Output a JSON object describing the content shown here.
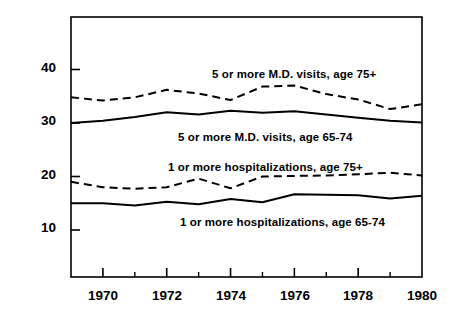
{
  "chart_data": {
    "type": "line",
    "title": "",
    "xlabel": "",
    "ylabel": "Percentage",
    "xlim": [
      1969,
      1980
    ],
    "ylim": [
      4.5,
      48
    ],
    "grid": false,
    "legend_position": "inline-annotations",
    "x": [
      1969,
      1970,
      1971,
      1972,
      1973,
      1974,
      1975,
      1976,
      1977,
      1978,
      1979,
      1980
    ],
    "x_tick_labels": [
      "1970",
      "1972",
      "1974",
      "1976",
      "1978",
      "1980"
    ],
    "x_major_ticks": [
      1970,
      1972,
      1974,
      1976,
      1978,
      1980
    ],
    "x_minor_ticks": [
      1971,
      1973,
      1975,
      1977,
      1979
    ],
    "y_tick_labels": [
      "10",
      "20",
      "30",
      "40"
    ],
    "y_ticks": [
      10,
      20,
      30,
      40
    ],
    "series": [
      {
        "name": "5 or more M.D. visits, age 75+",
        "style": "dashed",
        "values": [
          34.8,
          34.2,
          34.8,
          36.2,
          35.5,
          34.3,
          36.8,
          37.0,
          35.4,
          34.4,
          32.6,
          33.5
        ]
      },
      {
        "name": "5 or more M.D. visits, age 65-74",
        "style": "solid",
        "values": [
          30.0,
          30.4,
          31.1,
          32.0,
          31.6,
          32.3,
          31.9,
          32.2,
          31.6,
          31.0,
          30.4,
          30.1
        ]
      },
      {
        "name": "1 or more hospitalizations, age 75+",
        "style": "dashed",
        "values": [
          19.0,
          18.0,
          17.7,
          18.0,
          19.6,
          17.8,
          20.0,
          20.1,
          20.2,
          20.4,
          20.7,
          20.2
        ]
      },
      {
        "name": "1 or more hospitalizations, age 65-74",
        "style": "solid",
        "values": [
          15.0,
          15.0,
          14.6,
          15.3,
          14.8,
          15.8,
          15.2,
          16.7,
          16.6,
          16.5,
          15.9,
          16.4
        ]
      }
    ],
    "annotations": [
      {
        "text": "5 or more M.D. visits, age 75+",
        "x_px": 212,
        "y_px": 68
      },
      {
        "text": "5 or more M.D. visits, age 65-74",
        "x_px": 178,
        "y_px": 131
      },
      {
        "text": "1 or more hospitalizations, age 75+",
        "x_px": 168,
        "y_px": 161
      },
      {
        "text": "1 or more hospitalizations, age 65-74",
        "x_px": 180,
        "y_px": 216
      }
    ],
    "colors": {
      "line": "#000000",
      "axis": "#000000",
      "background": "#ffffff",
      "text": "#000000"
    }
  }
}
